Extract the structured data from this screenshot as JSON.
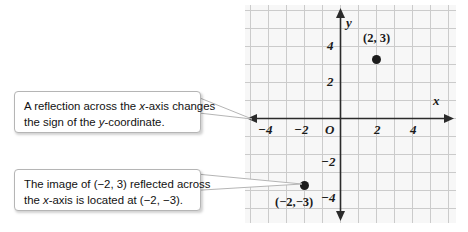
{
  "figure": {
    "type": "coordinate-plane-diagram",
    "background_color": "#ffffff",
    "panel_color": "#f7f7f7",
    "grid_color": "#c9c9c9",
    "axis_color": "#2b2b2b",
    "point_color": "#1c1c1c"
  },
  "graph": {
    "x_axis_label": "x",
    "y_axis_label": "y",
    "origin_label": "O",
    "x_ticks": [
      "−4",
      "−2",
      "2",
      "4"
    ],
    "y_ticks": [
      "4",
      "2",
      "−2",
      "−4"
    ],
    "x_range": [
      -5,
      5
    ],
    "y_range": [
      -5,
      5
    ],
    "grid_spacing_units": 1,
    "tick_interval": 2,
    "points": [
      {
        "label": "(2, 3)",
        "x": 2,
        "y": 3
      },
      {
        "label": "(−2,−3)",
        "x": -2,
        "y": -3
      }
    ]
  },
  "callouts": [
    {
      "id": "reflection-rule",
      "line1_a": "A reflection across the ",
      "line1_it": "x",
      "line1_b": "-axis changes",
      "line2_a": "the sign of the ",
      "line2_it": "y",
      "line2_b": "-coordinate."
    },
    {
      "id": "image-location",
      "line1_a": "The image of (−2, 3) reflected across",
      "line1_it": "",
      "line1_b": "",
      "line2_a": "the ",
      "line2_it": "x",
      "line2_b": "-axis is located at (−2, −3)."
    }
  ]
}
